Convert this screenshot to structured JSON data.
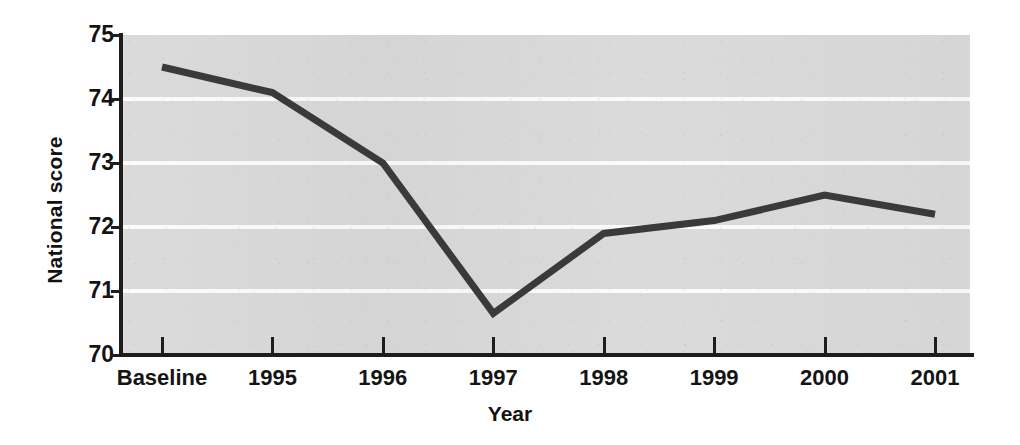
{
  "chart_data": {
    "type": "line",
    "title": "",
    "xlabel": "Year",
    "ylabel": "National score",
    "categories": [
      "Baseline",
      "1995",
      "1996",
      "1997",
      "1998",
      "1999",
      "2000",
      "2001"
    ],
    "values": [
      74.5,
      74.1,
      73.0,
      70.65,
      71.9,
      72.1,
      72.5,
      72.2
    ],
    "series": [
      {
        "name": "National score",
        "values": [
          74.5,
          74.1,
          73.0,
          70.65,
          71.9,
          72.1,
          72.5,
          72.2
        ]
      }
    ],
    "ylim": [
      70,
      75
    ],
    "yticks": [
      "75",
      "74",
      "73",
      "72",
      "71",
      "70"
    ],
    "ytick_values": [
      75,
      74,
      73,
      72,
      71,
      70
    ],
    "grid": true,
    "grid_axis": "y",
    "grid_color": "#fbfbfb",
    "legend": "none",
    "line_color": "#3a3a3a",
    "line_width": 7,
    "markers": "none",
    "plot_background": "#d9d9d9",
    "axis_color": "#1d1d1d",
    "page_background": "#ffffff"
  }
}
